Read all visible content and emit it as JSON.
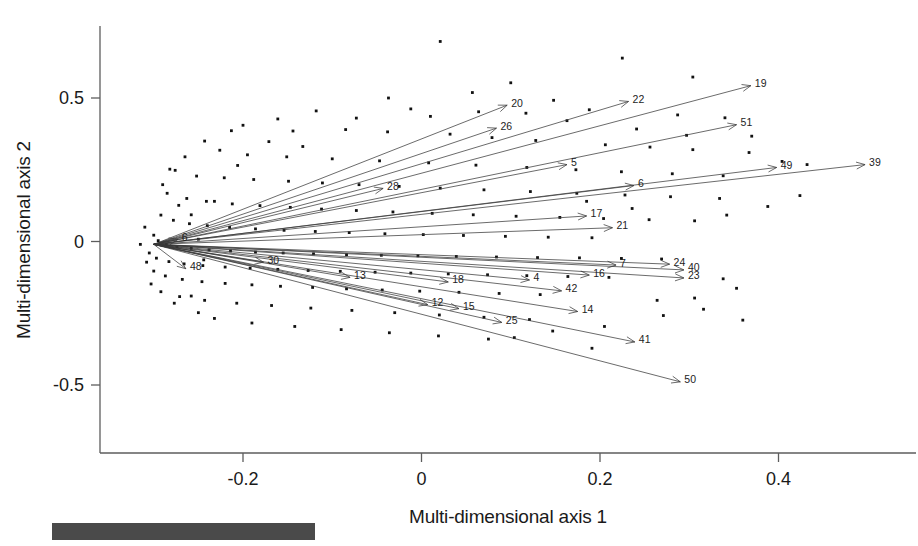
{
  "figure": {
    "kind": "ordination-biplot",
    "caption_bar_visible": true,
    "caption_bar_color": "#4a4a4a"
  },
  "chart_data": {
    "type": "scatter",
    "title": "",
    "xlabel": "Multi-dimensional axis 1",
    "ylabel": "Multi-dimensional axis 2",
    "xlim": [
      -0.33,
      0.56
    ],
    "ylim": [
      -0.78,
      0.78
    ],
    "xticks": [
      -0.2,
      0,
      0.2,
      0.4
    ],
    "xticklabels": [
      "-0.2",
      "0",
      "0.2",
      "0.4"
    ],
    "yticks": [
      0.5,
      0,
      -0.5
    ],
    "yticklabels": [
      "0.5",
      "0",
      "-0.5"
    ],
    "grid": false,
    "legend": "none",
    "vector_origin": [
      -0.3,
      -0.01
    ],
    "vectors": [
      {
        "label": "19",
        "x": 0.369,
        "y": 0.543
      },
      {
        "label": "22",
        "x": 0.232,
        "y": 0.488
      },
      {
        "label": "51",
        "x": 0.353,
        "y": 0.407
      },
      {
        "label": "20",
        "x": 0.096,
        "y": 0.475
      },
      {
        "label": "26",
        "x": 0.084,
        "y": 0.395
      },
      {
        "label": "39",
        "x": 0.497,
        "y": 0.268
      },
      {
        "label": "49",
        "x": 0.398,
        "y": 0.258
      },
      {
        "label": "5",
        "x": 0.163,
        "y": 0.268
      },
      {
        "label": "6",
        "x": 0.238,
        "y": 0.195
      },
      {
        "label": "28",
        "x": -0.043,
        "y": 0.185
      },
      {
        "label": "17",
        "x": 0.185,
        "y": 0.089
      },
      {
        "label": "21",
        "x": 0.214,
        "y": 0.048
      },
      {
        "label": "6b",
        "x": -0.273,
        "y": 0.007
      },
      {
        "label": "24",
        "x": 0.278,
        "y": -0.079
      },
      {
        "label": "40",
        "x": 0.294,
        "y": -0.099
      },
      {
        "label": "23",
        "x": 0.294,
        "y": -0.127
      },
      {
        "label": "7",
        "x": 0.218,
        "y": -0.082
      },
      {
        "label": "16",
        "x": 0.188,
        "y": -0.117
      },
      {
        "label": "4",
        "x": 0.121,
        "y": -0.134
      },
      {
        "label": "42",
        "x": 0.157,
        "y": -0.172
      },
      {
        "label": "18",
        "x": 0.03,
        "y": -0.141
      },
      {
        "label": "13",
        "x": -0.08,
        "y": -0.125
      },
      {
        "label": "14",
        "x": 0.175,
        "y": -0.244
      },
      {
        "label": "12",
        "x": 0.007,
        "y": -0.22
      },
      {
        "label": "15",
        "x": 0.042,
        "y": -0.234
      },
      {
        "label": "25",
        "x": 0.09,
        "y": -0.282
      },
      {
        "label": "41",
        "x": 0.239,
        "y": -0.35
      },
      {
        "label": "50",
        "x": 0.29,
        "y": -0.489
      },
      {
        "label": "48",
        "x": -0.264,
        "y": -0.095
      },
      {
        "label": "30",
        "x": -0.177,
        "y": -0.072
      }
    ],
    "points": [
      [
        0.021,
        0.697
      ],
      [
        0.225,
        0.639
      ],
      [
        0.304,
        0.573
      ],
      [
        0.1,
        0.553
      ],
      [
        0.057,
        0.519
      ],
      [
        -0.037,
        0.5
      ],
      [
        0.148,
        0.492
      ],
      [
        0.188,
        0.459
      ],
      [
        0.287,
        0.441
      ],
      [
        0.34,
        0.431
      ],
      [
        -0.118,
        0.455
      ],
      [
        -0.161,
        0.427
      ],
      [
        -0.073,
        0.43
      ],
      [
        0.01,
        0.436
      ],
      [
        -0.2,
        0.405
      ],
      [
        -0.213,
        0.386
      ],
      [
        -0.144,
        0.385
      ],
      [
        -0.085,
        0.39
      ],
      [
        -0.038,
        0.382
      ],
      [
        0.032,
        0.374
      ],
      [
        0.079,
        0.362
      ],
      [
        0.128,
        0.352
      ],
      [
        0.206,
        0.337
      ],
      [
        0.256,
        0.329
      ],
      [
        0.304,
        0.32
      ],
      [
        0.367,
        0.31
      ],
      [
        -0.243,
        0.35
      ],
      [
        -0.226,
        0.318
      ],
      [
        -0.265,
        0.295
      ],
      [
        -0.195,
        0.302
      ],
      [
        -0.151,
        0.295
      ],
      [
        -0.1,
        0.288
      ],
      [
        -0.047,
        0.281
      ],
      [
        0.008,
        0.274
      ],
      [
        0.061,
        0.266
      ],
      [
        0.118,
        0.258
      ],
      [
        0.173,
        0.25
      ],
      [
        0.224,
        0.243
      ],
      [
        0.281,
        0.236
      ],
      [
        0.338,
        0.229
      ],
      [
        -0.276,
        0.248
      ],
      [
        -0.252,
        0.228
      ],
      [
        -0.221,
        0.222
      ],
      [
        -0.188,
        0.216
      ],
      [
        -0.149,
        0.21
      ],
      [
        -0.111,
        0.204
      ],
      [
        -0.07,
        0.198
      ],
      [
        -0.025,
        0.192
      ],
      [
        0.021,
        0.186
      ],
      [
        0.07,
        0.18
      ],
      [
        0.122,
        0.174
      ],
      [
        0.174,
        0.168
      ],
      [
        0.228,
        0.162
      ],
      [
        0.279,
        0.156
      ],
      [
        0.334,
        0.15
      ],
      [
        -0.285,
        0.168
      ],
      [
        -0.263,
        0.15
      ],
      [
        -0.241,
        0.14
      ],
      [
        -0.212,
        0.131
      ],
      [
        -0.181,
        0.125
      ],
      [
        -0.147,
        0.119
      ],
      [
        -0.112,
        0.113
      ],
      [
        -0.073,
        0.108
      ],
      [
        -0.032,
        0.103
      ],
      [
        0.012,
        0.098
      ],
      [
        0.058,
        0.093
      ],
      [
        0.106,
        0.088
      ],
      [
        0.155,
        0.084
      ],
      [
        0.204,
        0.08
      ],
      [
        0.255,
        0.076
      ],
      [
        0.306,
        0.072
      ],
      [
        -0.292,
        0.092
      ],
      [
        -0.278,
        0.074
      ],
      [
        -0.26,
        0.062
      ],
      [
        -0.24,
        0.055
      ],
      [
        -0.215,
        0.049
      ],
      [
        -0.186,
        0.044
      ],
      [
        -0.154,
        0.039
      ],
      [
        -0.119,
        0.035
      ],
      [
        -0.081,
        0.031
      ],
      [
        -0.041,
        0.027
      ],
      [
        0.002,
        0.024
      ],
      [
        0.047,
        0.021
      ],
      [
        0.094,
        0.018
      ],
      [
        0.142,
        0.015
      ],
      [
        0.191,
        0.013
      ],
      [
        -0.3,
        0.022
      ],
      [
        -0.295,
        0.003
      ],
      [
        -0.286,
        -0.01
      ],
      [
        -0.274,
        -0.018
      ],
      [
        -0.258,
        -0.024
      ],
      [
        -0.238,
        -0.029
      ],
      [
        -0.214,
        -0.033
      ],
      [
        -0.186,
        -0.037
      ],
      [
        -0.155,
        -0.04
      ],
      [
        -0.121,
        -0.043
      ],
      [
        -0.084,
        -0.046
      ],
      [
        -0.045,
        -0.048
      ],
      [
        -0.004,
        -0.05
      ],
      [
        0.039,
        -0.052
      ],
      [
        0.084,
        -0.054
      ],
      [
        0.13,
        -0.056
      ],
      [
        0.177,
        -0.057
      ],
      [
        0.224,
        -0.059
      ],
      [
        0.269,
        -0.061
      ],
      [
        -0.305,
        -0.04
      ],
      [
        -0.297,
        -0.058
      ],
      [
        -0.283,
        -0.07
      ],
      [
        -0.266,
        -0.078
      ],
      [
        -0.245,
        -0.084
      ],
      [
        -0.22,
        -0.089
      ],
      [
        -0.192,
        -0.093
      ],
      [
        -0.161,
        -0.097
      ],
      [
        -0.127,
        -0.101
      ],
      [
        -0.091,
        -0.104
      ],
      [
        -0.052,
        -0.107
      ],
      [
        -0.012,
        -0.11
      ],
      [
        0.03,
        -0.113
      ],
      [
        0.074,
        -0.116
      ],
      [
        0.118,
        -0.119
      ],
      [
        0.164,
        -0.122
      ],
      [
        0.21,
        -0.125
      ],
      [
        -0.3,
        -0.103
      ],
      [
        -0.287,
        -0.12
      ],
      [
        -0.268,
        -0.132
      ],
      [
        -0.246,
        -0.14
      ],
      [
        -0.22,
        -0.146
      ],
      [
        -0.19,
        -0.151
      ],
      [
        -0.158,
        -0.156
      ],
      [
        -0.122,
        -0.16
      ],
      [
        -0.084,
        -0.165
      ],
      [
        -0.044,
        -0.169
      ],
      [
        -0.002,
        -0.173
      ],
      [
        0.042,
        -0.177
      ],
      [
        0.087,
        -0.181
      ],
      [
        0.133,
        -0.185
      ],
      [
        -0.271,
        -0.192
      ],
      [
        -0.243,
        -0.205
      ],
      [
        -0.207,
        -0.215
      ],
      [
        -0.168,
        -0.223
      ],
      [
        -0.124,
        -0.232
      ],
      [
        -0.078,
        -0.24
      ],
      [
        -0.03,
        -0.248
      ],
      [
        0.02,
        -0.256
      ],
      [
        0.07,
        -0.264
      ],
      [
        0.121,
        -0.272
      ],
      [
        -0.232,
        -0.268
      ],
      [
        -0.19,
        -0.284
      ],
      [
        -0.142,
        -0.296
      ],
      [
        -0.09,
        -0.307
      ],
      [
        -0.036,
        -0.318
      ],
      [
        0.019,
        -0.329
      ],
      [
        0.075,
        -0.34
      ],
      [
        -0.29,
        0.198
      ],
      [
        -0.282,
        0.252
      ],
      [
        -0.272,
        0.126
      ],
      [
        -0.303,
        -0.148
      ],
      [
        -0.292,
        -0.175
      ],
      [
        -0.277,
        -0.215
      ],
      [
        -0.25,
        -0.248
      ],
      [
        -0.232,
        0.14
      ],
      [
        -0.258,
        -0.19
      ],
      [
        -0.206,
        0.265
      ],
      [
        -0.171,
        0.348
      ],
      [
        -0.133,
        0.331
      ],
      [
        0.117,
        0.447
      ],
      [
        0.241,
        0.392
      ],
      [
        0.297,
        0.37
      ],
      [
        0.37,
        0.367
      ],
      [
        0.404,
        0.279
      ],
      [
        0.432,
        0.268
      ],
      [
        0.163,
        0.421
      ],
      [
        0.064,
        0.452
      ],
      [
        -0.012,
        0.462
      ],
      [
        0.338,
        -0.13
      ],
      [
        0.353,
        -0.163
      ],
      [
        0.306,
        -0.197
      ],
      [
        0.264,
        -0.205
      ],
      [
        0.316,
        -0.236
      ],
      [
        0.271,
        -0.258
      ],
      [
        0.36,
        -0.274
      ],
      [
        0.205,
        -0.296
      ],
      [
        0.147,
        -0.312
      ],
      [
        0.104,
        -0.335
      ],
      [
        0.191,
        -0.372
      ],
      [
        -0.258,
        0.093
      ],
      [
        -0.25,
        0.008
      ],
      [
        -0.244,
        -0.064
      ],
      [
        0.424,
        0.16
      ],
      [
        0.388,
        0.122
      ],
      [
        0.342,
        0.092
      ],
      [
        0.236,
        0.115
      ],
      [
        0.185,
        0.14
      ],
      [
        -0.31,
        0.05
      ],
      [
        -0.315,
        -0.01
      ],
      [
        -0.308,
        -0.072
      ]
    ]
  },
  "caption": {
    "faint_text": ""
  }
}
